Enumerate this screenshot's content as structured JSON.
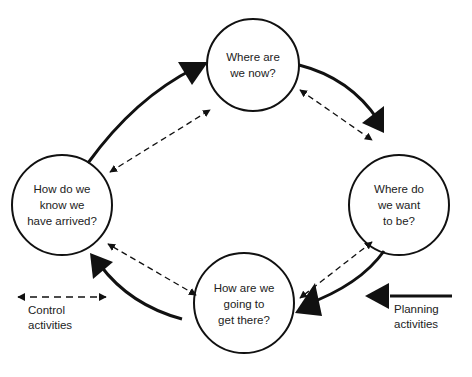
{
  "diagram": {
    "type": "cycle",
    "nodes": [
      {
        "id": "now",
        "label": "Where are\nwe now?"
      },
      {
        "id": "want",
        "label": "Where do\nwe want\nto be?"
      },
      {
        "id": "get",
        "label": "How are we\ngoing to\nget there?"
      },
      {
        "id": "arrived",
        "label": "How do we\nknow we\nhave arrived?"
      }
    ],
    "edges": [
      {
        "from": "now",
        "to": "want",
        "style": "solid"
      },
      {
        "from": "want",
        "to": "get",
        "style": "solid"
      },
      {
        "from": "get",
        "to": "arrived",
        "style": "solid"
      },
      {
        "from": "arrived",
        "to": "now",
        "style": "solid"
      },
      {
        "from": "now",
        "to": "want",
        "style": "dashed-bidirectional"
      },
      {
        "from": "want",
        "to": "get",
        "style": "dashed-bidirectional"
      },
      {
        "from": "get",
        "to": "arrived",
        "style": "dashed-bidirectional"
      },
      {
        "from": "arrived",
        "to": "now",
        "style": "dashed-bidirectional"
      }
    ]
  },
  "legend": {
    "control": "Control\nactivities",
    "planning": "Planning\nactivities"
  },
  "colors": {
    "stroke": "#111111",
    "text": "#222222"
  }
}
